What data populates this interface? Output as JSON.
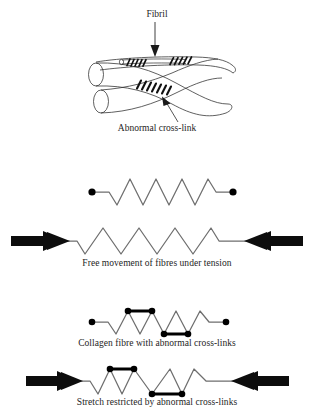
{
  "figure": {
    "background_color": "#ffffff",
    "line_color": "#6e6e6e",
    "node_color": "#000000",
    "outline_color": "#2b2b2b",
    "text_color": "#242424"
  },
  "labels": {
    "fibril": "Fibril",
    "abnormal_crosslink": "Abnormal cross-link"
  },
  "captions": {
    "free_movement": "Free movement of fibres under tension",
    "collagen_fibre": "Collagen fibre with abnormal cross-links",
    "stretch_restricted": "Stretch restricted by abnormal cross-links"
  },
  "panels": [
    {
      "id": "fibril-bundle",
      "name": "fibril-bundle-illustration",
      "description": "Three tubular collagen fibrils crossing, with dark abnormal cross-link bands",
      "fibril_count": 3,
      "crosslink_bands": 3,
      "pointer_labels": [
        "Fibril",
        "Abnormal cross-link"
      ]
    },
    {
      "id": "relaxed-fibre",
      "name": "relaxed-zigzag-fibre",
      "zigzag_peaks": 5,
      "end_nodes": 2,
      "arrows": 0,
      "crosslinks": 0
    },
    {
      "id": "tensioned-fibre",
      "name": "tensioned-zigzag-fibre",
      "zigzag_peaks": 5,
      "end_nodes": 0,
      "arrows": 2,
      "crosslinks": 0,
      "caption": "Free movement of fibres under tension"
    },
    {
      "id": "crosslinked-fibre",
      "name": "crosslinked-zigzag-fibre",
      "zigzag_peaks": 5,
      "end_nodes": 2,
      "arrows": 0,
      "crosslinks": 2,
      "crosslink_positions": [
        "top-peaks-1-2",
        "bottom-valleys-3-4"
      ],
      "caption": "Collagen fibre with abnormal cross-links"
    },
    {
      "id": "restricted-fibre",
      "name": "restricted-zigzag-fibre",
      "zigzag_peaks": 5,
      "end_nodes": 0,
      "arrows": 2,
      "crosslinks": 2,
      "crosslink_positions": [
        "top-peaks-1-2",
        "bottom-valleys-3-4"
      ],
      "caption": "Stretch restricted by abnormal cross-links"
    }
  ]
}
